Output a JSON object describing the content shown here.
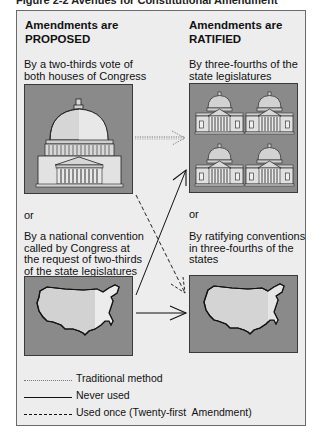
{
  "figure": {
    "title": "Figure 2-2 Avenues for Constitutional Amendment"
  },
  "columns": {
    "proposed": {
      "heading_line1": "Amendments are",
      "heading_line2": "PROPOSED",
      "method1": {
        "lines": [
          "By a two-thirds vote of",
          "both houses of Congress"
        ],
        "image": "us-capitol-icon"
      },
      "or_label": "or",
      "method2": {
        "lines": [
          "By a national convention",
          "called by Congress at",
          "the request of two-thirds",
          "of the state legislatures"
        ],
        "image": "us-map-icon"
      }
    },
    "ratified": {
      "heading_line1": "Amendments are",
      "heading_line2": "RATIFIED",
      "method1": {
        "lines": [
          "By three-fourths of the",
          "state legislatures"
        ],
        "image": "state-capitols-icon"
      },
      "or_label": "or",
      "method2": {
        "lines": [
          "By ratifying conventions",
          "in three-fourths of the",
          "states"
        ],
        "image": "us-map-icon"
      }
    }
  },
  "arrows": [
    {
      "from": "congress-vote",
      "to": "state-legislatures",
      "style": "dotted"
    },
    {
      "from": "congress-vote",
      "to": "state-conventions",
      "style": "dashed"
    },
    {
      "from": "national-convention",
      "to": "state-legislatures",
      "style": "solid"
    },
    {
      "from": "national-convention",
      "to": "state-conventions",
      "style": "solid"
    }
  ],
  "legend": {
    "items": [
      {
        "style": "dotted",
        "label": "Traditional method"
      },
      {
        "style": "solid",
        "label": "Never used"
      },
      {
        "style": "dashed",
        "label": "Used once (Twenty-first  Amendment)"
      }
    ]
  },
  "colors": {
    "frame_bg": "#ededed",
    "image_bg": "#8a8a8a",
    "building_light": "#e6e6e6",
    "building_mid": "#c4c4c4",
    "map_light": "#d2d2d2",
    "map_lighter": "#e8e8e8"
  }
}
